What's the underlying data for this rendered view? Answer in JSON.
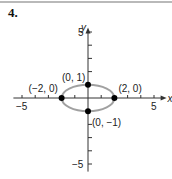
{
  "problem_number": "4.",
  "colors": {
    "curve": "#a0a0a0",
    "axis": "#333333",
    "point": "#000000",
    "rule": "#b9b9b9"
  },
  "chart_data": {
    "type": "scatter",
    "title": "",
    "xlabel": "x",
    "ylabel": "y",
    "xlim": [
      -5.5,
      5.5
    ],
    "ylim": [
      -5.5,
      5.5
    ],
    "x_tick_labels": [
      "-5",
      "5"
    ],
    "y_tick_labels": [
      "5",
      "-5"
    ],
    "grid": false,
    "curve": {
      "kind": "ellipse",
      "center": [
        0,
        0
      ],
      "rx": 2,
      "ry": 1,
      "equation": "x^2/4 + y^2 = 1"
    },
    "points": [
      {
        "x": 0,
        "y": 1,
        "label": "(0, 1)"
      },
      {
        "x": -2,
        "y": 0,
        "label": "(−2, 0)"
      },
      {
        "x": 2,
        "y": 0,
        "label": "(2, 0)"
      },
      {
        "x": 0,
        "y": -1,
        "label": "(0, −1)"
      }
    ]
  }
}
